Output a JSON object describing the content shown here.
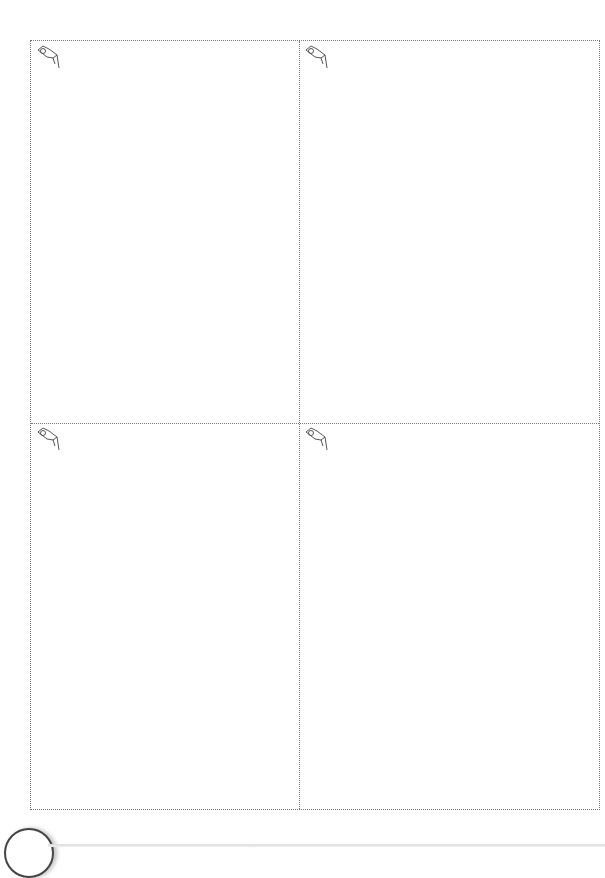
{
  "page": {
    "ghost_text": "",
    "panels": [
      {
        "id": "top-left",
        "icon": "drawing-hand-icon"
      },
      {
        "id": "top-right",
        "icon": "drawing-hand-icon"
      },
      {
        "id": "bottom-left",
        "icon": "drawing-hand-icon"
      },
      {
        "id": "bottom-right",
        "icon": "drawing-hand-icon"
      }
    ]
  }
}
